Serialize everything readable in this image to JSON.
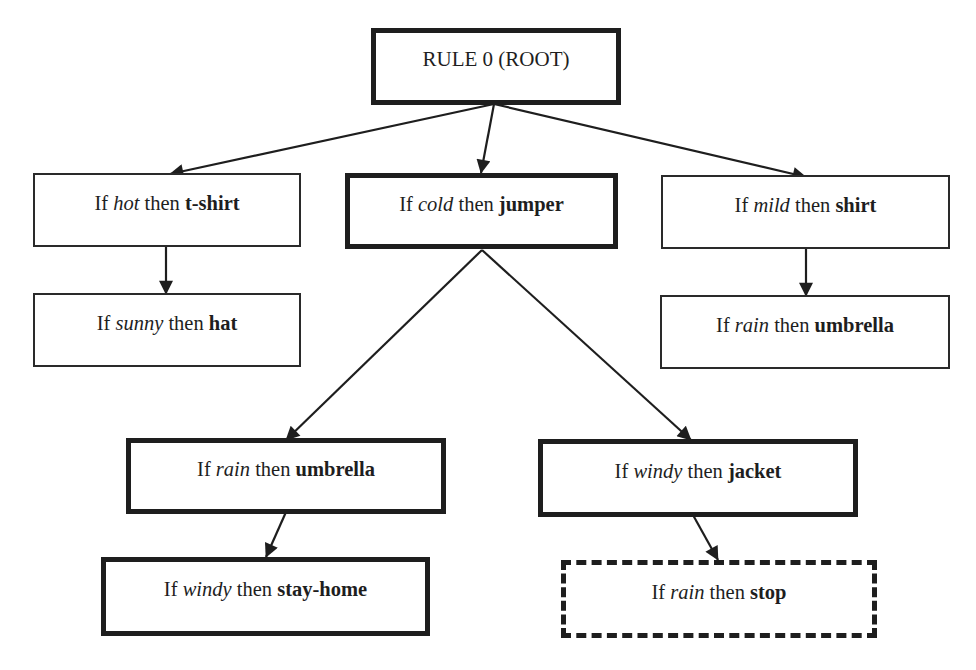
{
  "diagram": {
    "type": "rule-tree",
    "root": {
      "label": "RULE 0 (ROOT)",
      "border": "thick"
    },
    "nodes": {
      "hot": {
        "if": "If ",
        "condition": "hot",
        "then": " then ",
        "action": "t-shirt",
        "border": "thin"
      },
      "sunny": {
        "if": "If ",
        "condition": "sunny",
        "then": " then ",
        "action": "hat",
        "border": "thin"
      },
      "cold": {
        "if": "If ",
        "condition": "cold",
        "then": " then ",
        "action": "jumper",
        "border": "thick"
      },
      "cold_rain": {
        "if": "If ",
        "condition": "rain",
        "then": " then ",
        "action": "umbrella",
        "border": "thick"
      },
      "rain_windy": {
        "if": "If ",
        "condition": "windy",
        "then": " then ",
        "action": "stay-home",
        "border": "thick"
      },
      "cold_windy": {
        "if": "If ",
        "condition": "windy",
        "then": " then ",
        "action": "jacket",
        "border": "thick"
      },
      "windy_rain": {
        "if": "If ",
        "condition": "rain",
        "then": " then ",
        "action": "stop",
        "border": "dashed"
      },
      "mild": {
        "if": "If ",
        "condition": "mild",
        "then": " then ",
        "action": "shirt",
        "border": "thin"
      },
      "mild_rain": {
        "if": "If ",
        "condition": "rain",
        "then": " then ",
        "action": "umbrella",
        "border": "thin"
      }
    },
    "edges": [
      {
        "from": "root",
        "to": "hot"
      },
      {
        "from": "root",
        "to": "cold"
      },
      {
        "from": "root",
        "to": "mild"
      },
      {
        "from": "hot",
        "to": "sunny"
      },
      {
        "from": "cold",
        "to": "cold_rain"
      },
      {
        "from": "cold",
        "to": "cold_windy"
      },
      {
        "from": "cold_rain",
        "to": "rain_windy"
      },
      {
        "from": "cold_windy",
        "to": "windy_rain"
      },
      {
        "from": "mild",
        "to": "mild_rain"
      }
    ],
    "colors": {
      "line": "#1e1e1e",
      "background": "#ffffff"
    }
  }
}
